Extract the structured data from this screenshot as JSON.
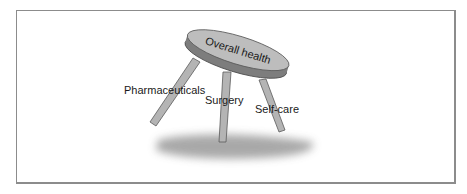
{
  "diagram": {
    "seat_label": "Overall health",
    "legs": [
      {
        "label": "Pharmaceuticals"
      },
      {
        "label": "Surgery"
      },
      {
        "label": "Self-care"
      }
    ],
    "colors": {
      "seat_top": "#bdbdbd",
      "seat_rim": "#7d7d7d",
      "leg_fill": "#b4b4b4",
      "leg_stroke": "#5a5a5a",
      "shadow": "#9a9a9a",
      "border": "#8c8c8c"
    }
  }
}
